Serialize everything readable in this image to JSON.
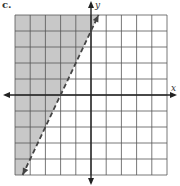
{
  "problem_label": "c.",
  "chart_data": {
    "type": "inequality-graph",
    "title": "",
    "xlabel": "x",
    "ylabel": "y",
    "xlim": [
      -5,
      5
    ],
    "ylim": [
      -5,
      5
    ],
    "grid": true,
    "grid_step": 1,
    "boundary_line": {
      "equation": "y = 2x + 4",
      "slope": 2,
      "y_intercept": 4,
      "x_intercept": -2,
      "style": "dashed",
      "arrows": "both"
    },
    "inequality": "y > 2x + 4",
    "shaded_region": "left/above the line",
    "colors": {
      "shade": "#c8c8c8",
      "grid": "#555555",
      "axes": "#222222",
      "line": "#444444"
    }
  }
}
